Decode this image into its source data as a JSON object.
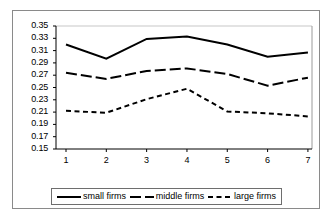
{
  "chart_data": {
    "type": "line",
    "title": "",
    "subtitle": "",
    "xlabel": "",
    "ylabel": "",
    "categories": [
      "1",
      "2",
      "3",
      "4",
      "5",
      "6",
      "7"
    ],
    "ylim": [
      0.15,
      0.35
    ],
    "yticks": [
      "0.35",
      "0.33",
      "0.31",
      "0.29",
      "0.27",
      "0.25",
      "0.23",
      "0.21",
      "0.19",
      "0.17",
      "0.15"
    ],
    "ytick_values": [
      0.35,
      0.33,
      0.31,
      0.29,
      0.27,
      0.25,
      0.23,
      0.21,
      0.19,
      0.17,
      0.15
    ],
    "grid": false,
    "legend_position": "bottom",
    "series": [
      {
        "name": "small firms",
        "style": "solid",
        "color": "#000000",
        "values": [
          0.32,
          0.297,
          0.329,
          0.333,
          0.32,
          0.3,
          0.307
        ]
      },
      {
        "name": "middle firms",
        "style": "long-dash",
        "color": "#000000",
        "values": [
          0.274,
          0.264,
          0.277,
          0.281,
          0.272,
          0.253,
          0.266
        ]
      },
      {
        "name": "large firms",
        "style": "short-dash",
        "color": "#000000",
        "values": [
          0.212,
          0.209,
          0.231,
          0.248,
          0.211,
          0.208,
          0.203
        ]
      }
    ]
  },
  "legend": {
    "items": [
      {
        "label": "small firms"
      },
      {
        "label": "middle firms"
      },
      {
        "label": "large firms"
      }
    ]
  }
}
